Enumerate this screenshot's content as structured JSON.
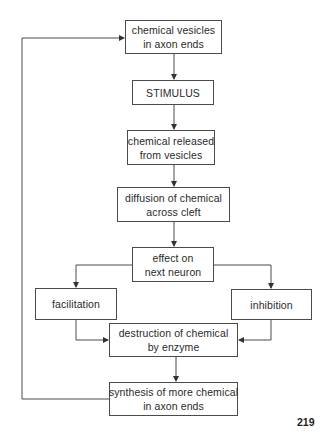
{
  "diagram": {
    "title": "",
    "colors": {
      "line": "#4a4a4a",
      "text": "#2a2a2a",
      "background": "#ffffff"
    },
    "nodes": [
      {
        "id": "vesicles",
        "lines": [
          "chemical vesicles",
          "in axon ends"
        ]
      },
      {
        "id": "stimulus",
        "lines": [
          "STIMULUS"
        ]
      },
      {
        "id": "released",
        "lines": [
          "chemical released",
          "from vesicles"
        ]
      },
      {
        "id": "diffusion",
        "lines": [
          "diffusion of chemical",
          "across cleft"
        ]
      },
      {
        "id": "effect",
        "lines": [
          "effect on",
          "next neuron"
        ]
      },
      {
        "id": "facilitation",
        "lines": [
          "facilitation"
        ]
      },
      {
        "id": "inhibition",
        "lines": [
          "inhibition"
        ]
      },
      {
        "id": "destruction",
        "lines": [
          "destruction of chemical",
          "by enzyme"
        ]
      },
      {
        "id": "synthesis",
        "lines": [
          "synthesis of more chemical",
          "in axon ends"
        ]
      }
    ],
    "edges": [
      {
        "from": "vesicles",
        "to": "stimulus"
      },
      {
        "from": "stimulus",
        "to": "released"
      },
      {
        "from": "released",
        "to": "diffusion"
      },
      {
        "from": "diffusion",
        "to": "effect"
      },
      {
        "from": "effect",
        "to": "facilitation"
      },
      {
        "from": "effect",
        "to": "inhibition"
      },
      {
        "from": "facilitation",
        "to": "destruction"
      },
      {
        "from": "inhibition",
        "to": "destruction"
      },
      {
        "from": "destruction",
        "to": "synthesis"
      },
      {
        "from": "synthesis",
        "to": "vesicles",
        "type": "feedback-loop"
      }
    ]
  },
  "page": {
    "number": "219"
  }
}
